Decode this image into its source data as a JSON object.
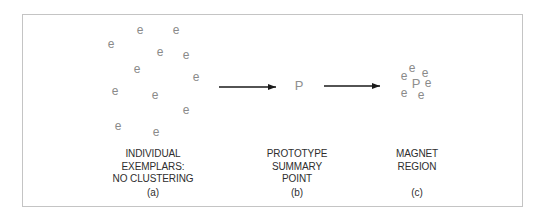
{
  "panels": [
    {
      "id": "a",
      "label_lines": [
        "INDIVIDUAL",
        "EXEMPLARS:",
        "NO CLUSTERING"
      ],
      "caption": "(a)",
      "label_center": [
        153,
        148
      ],
      "caption_center": [
        153,
        192
      ],
      "glyphs": [
        {
          "text": "e",
          "x": 140,
          "y": 30
        },
        {
          "text": "e",
          "x": 176,
          "y": 30
        },
        {
          "text": "e",
          "x": 111,
          "y": 44
        },
        {
          "text": "e",
          "x": 160,
          "y": 52
        },
        {
          "text": "e",
          "x": 186,
          "y": 55
        },
        {
          "text": "e",
          "x": 137,
          "y": 69
        },
        {
          "text": "e",
          "x": 196,
          "y": 77
        },
        {
          "text": "e",
          "x": 115,
          "y": 91
        },
        {
          "text": "e",
          "x": 155,
          "y": 95
        },
        {
          "text": "e",
          "x": 186,
          "y": 110
        },
        {
          "text": "e",
          "x": 118,
          "y": 126
        },
        {
          "text": "e",
          "x": 156,
          "y": 132
        }
      ]
    },
    {
      "id": "b",
      "label_lines": [
        "PROTOTYPE",
        "SUMMARY",
        "POINT"
      ],
      "caption": "(b)",
      "label_center": [
        297,
        148
      ],
      "caption_center": [
        297,
        192
      ],
      "glyphs": [
        {
          "text": "P",
          "x": 299,
          "y": 86
        }
      ]
    },
    {
      "id": "c",
      "label_lines": [
        "MAGNET",
        "REGION"
      ],
      "caption": "(c)",
      "label_center": [
        417,
        148
      ],
      "caption_center": [
        417,
        192
      ],
      "glyphs": [
        {
          "text": "e",
          "x": 412,
          "y": 68
        },
        {
          "text": "e",
          "x": 425,
          "y": 73
        },
        {
          "text": "e",
          "x": 404,
          "y": 76
        },
        {
          "text": "P",
          "x": 416,
          "y": 84
        },
        {
          "text": "e",
          "x": 428,
          "y": 83
        },
        {
          "text": "e",
          "x": 404,
          "y": 93
        },
        {
          "text": "e",
          "x": 421,
          "y": 95
        }
      ]
    }
  ],
  "arrows": [
    {
      "from": [
        219,
        87
      ],
      "to": [
        276,
        87
      ]
    },
    {
      "from": [
        324,
        86
      ],
      "to": [
        380,
        86
      ]
    }
  ],
  "colors": {
    "glyph": "#8a8a8a",
    "text": "#2e2e2e",
    "arrow": "#1a1a1a",
    "frame": "#c4c4c4"
  }
}
